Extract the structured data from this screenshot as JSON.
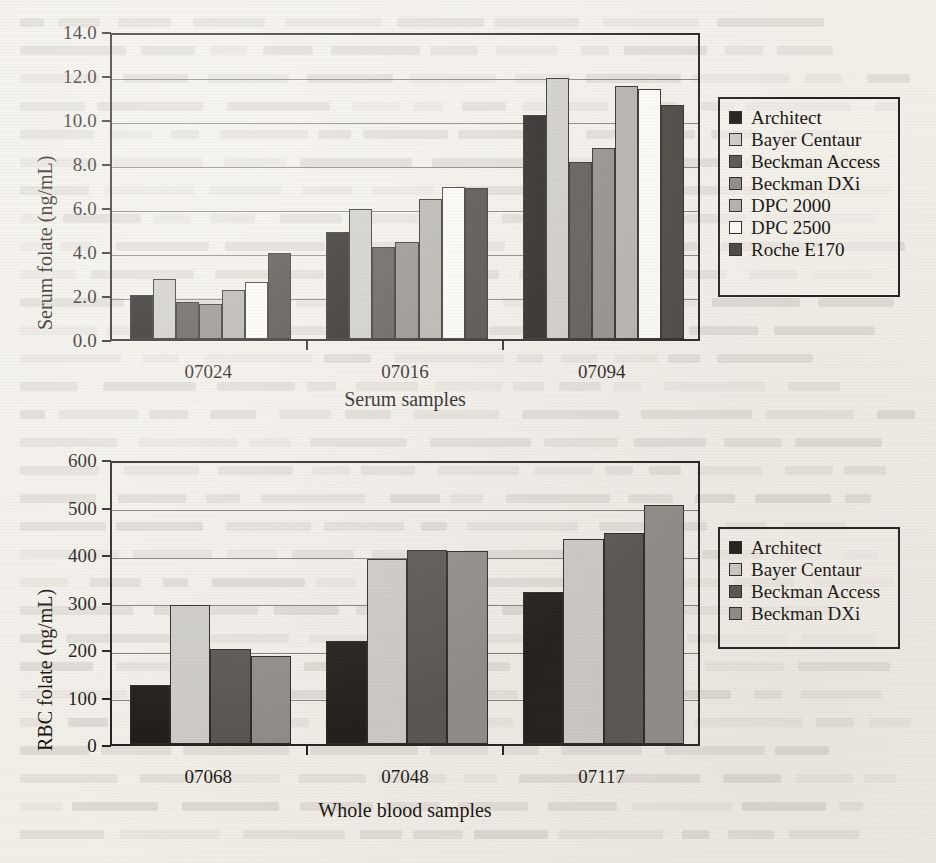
{
  "page": {
    "background_color": "#f2efe9",
    "ink_color": "#1c1815"
  },
  "figure_top": {
    "name": "serum-folate-chart",
    "y_axis_title": "Serum folate (ng/mL)",
    "x_axis_title": "Serum samples",
    "y_ticks": [
      "0.0",
      "2.0",
      "4.0",
      "6.0",
      "8.0",
      "10.0",
      "12.0",
      "14.0"
    ],
    "legend_title": "",
    "legend_items": [
      {
        "label": "Architect",
        "color": "#1d1a18"
      },
      {
        "label": "Bayer Centaur",
        "color": "#cdcbc6"
      },
      {
        "label": "Beckman Access",
        "color": "#56524e"
      },
      {
        "label": "Beckman DXi",
        "color": "#8e8b86"
      },
      {
        "label": "DPC 2000",
        "color": "#b3b0ab"
      },
      {
        "label": "DPC 2500",
        "color": "#fbfaf7"
      },
      {
        "label": "Roche E170",
        "color": "#45413d"
      }
    ]
  },
  "figure_bottom": {
    "name": "rbc-folate-chart",
    "y_axis_title": "RBC folate (ng/mL)",
    "x_axis_title": "Whole blood samples",
    "y_ticks": [
      "0",
      "100",
      "200",
      "300",
      "400",
      "500",
      "600"
    ],
    "legend_items": [
      {
        "label": "Architect",
        "color": "#1d1a18"
      },
      {
        "label": "Bayer Centaur",
        "color": "#cdcbc6"
      },
      {
        "label": "Beckman Access",
        "color": "#56524e"
      },
      {
        "label": "Beckman DXi",
        "color": "#8e8b86"
      }
    ]
  },
  "chart_data": [
    {
      "type": "bar",
      "title": "",
      "xlabel": "Serum samples",
      "ylabel": "Serum folate (ng/mL)",
      "ylim": [
        0,
        14
      ],
      "ytick_step": 2,
      "grid": true,
      "legend_position": "right",
      "categories": [
        "07024",
        "07016",
        "07094"
      ],
      "series": [
        {
          "name": "Architect",
          "color": "#1d1a18",
          "values": [
            2.0,
            4.85,
            10.2
          ]
        },
        {
          "name": "Bayer Centaur",
          "color": "#cdcbc6",
          "values": [
            2.75,
            5.9,
            11.85
          ]
        },
        {
          "name": "Beckman Access",
          "color": "#56524e",
          "values": [
            1.7,
            4.2,
            8.05
          ]
        },
        {
          "name": "Beckman DXi",
          "color": "#8e8b86",
          "values": [
            1.6,
            4.4,
            8.7
          ]
        },
        {
          "name": "DPC 2000",
          "color": "#b3b0ab",
          "values": [
            2.25,
            6.35,
            11.5
          ]
        },
        {
          "name": "DPC 2500",
          "color": "#fbfaf7",
          "values": [
            2.6,
            6.9,
            11.35
          ]
        },
        {
          "name": "Roche E170",
          "color": "#45413d",
          "values": [
            3.9,
            6.85,
            10.65
          ]
        }
      ]
    },
    {
      "type": "bar",
      "title": "",
      "xlabel": "Whole blood samples",
      "ylabel": "RBC folate (ng/mL)",
      "ylim": [
        0,
        600
      ],
      "ytick_step": 100,
      "grid": true,
      "legend_position": "right",
      "categories": [
        "07068",
        "07048",
        "07117"
      ],
      "series": [
        {
          "name": "Architect",
          "color": "#1d1a18",
          "values": [
            125,
            216,
            320
          ]
        },
        {
          "name": "Bayer Centaur",
          "color": "#cdcbc6",
          "values": [
            292,
            390,
            432
          ]
        },
        {
          "name": "Beckman Access",
          "color": "#56524e",
          "values": [
            201,
            409,
            444
          ]
        },
        {
          "name": "Beckman DXi",
          "color": "#8e8b86",
          "values": [
            186,
            407,
            503
          ]
        }
      ]
    }
  ]
}
